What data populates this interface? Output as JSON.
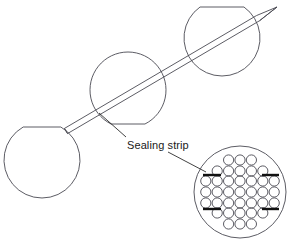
{
  "diagram": {
    "background_color": "#ffffff",
    "line_color": "#4a4a52",
    "accent_color": "#111111",
    "text_color": "#1a1a1a",
    "labels": {
      "sealing_strip": "Sealing strip"
    },
    "shells": [
      {
        "name": "lower-left-shell",
        "cx": 42,
        "cy": 160,
        "r": 38,
        "chord": "top",
        "chord_y": 127
      },
      {
        "name": "middle-shell",
        "cx": 128,
        "cy": 90,
        "r": 38,
        "chord": "bottom",
        "chord_y": 124
      },
      {
        "name": "upper-right-shell",
        "cx": 222,
        "cy": 38,
        "r": 38,
        "chord": "top",
        "chord_y": 7
      }
    ],
    "strip": {
      "name": "sealing-strip-band",
      "start_x": 66,
      "start_y": 131,
      "end_x": 277,
      "end_y": 7,
      "thickness": 6,
      "tip": "pointed-right",
      "tail": "blunt-left"
    },
    "leader_lines": [
      {
        "name": "leader-to-strip",
        "from_x": 126,
        "from_y": 137,
        "to_x": 99,
        "to_y": 113
      },
      {
        "name": "leader-to-detail",
        "from_x": 168,
        "from_y": 152,
        "to_x": 206,
        "to_y": 172
      }
    ],
    "detail_circle": {
      "name": "tube-layout-detail",
      "cx": 240,
      "cy": 192,
      "r": 46,
      "tube_radius": 5.1,
      "tube_row_spacing": 10.6,
      "tube_col_spacing": 11.4,
      "rows": [
        {
          "count": 3,
          "y": 160
        },
        {
          "count": 5,
          "y": 171
        },
        {
          "count": 7,
          "y": 181
        },
        {
          "count": 7,
          "y": 192
        },
        {
          "count": 7,
          "y": 203
        },
        {
          "count": 5,
          "y": 213
        },
        {
          "count": 3,
          "y": 224
        }
      ],
      "strip_marks": [
        {
          "name": "strip-mark-upper-left",
          "x1": 203,
          "y1": 175,
          "x2": 221,
          "y2": 175
        },
        {
          "name": "strip-mark-upper-right",
          "x1": 262,
          "y1": 175,
          "x2": 279,
          "y2": 175
        },
        {
          "name": "strip-mark-lower-left",
          "x1": 203,
          "y1": 209,
          "x2": 221,
          "y2": 209
        },
        {
          "name": "strip-mark-lower-right",
          "x1": 262,
          "y1": 209,
          "x2": 279,
          "y2": 209
        }
      ]
    }
  }
}
